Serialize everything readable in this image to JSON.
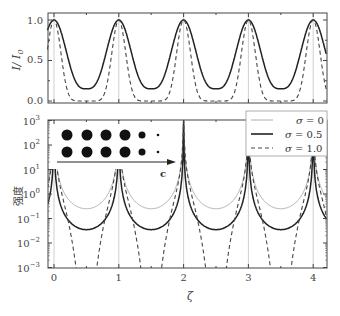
{
  "chart_data": [
    {
      "type": "line",
      "panel": "top",
      "ylabel": "I / I0",
      "ylabel_display": "I/ I₀",
      "xlim": [
        -0.1,
        4.2
      ],
      "ylim": [
        0.0,
        1.1
      ],
      "yticks": [
        0.0,
        0.5,
        1.0
      ],
      "ytick_labels": [
        "0.0",
        "0.5",
        "1.0"
      ],
      "xticks": [
        0,
        1,
        2,
        3,
        4
      ],
      "vertical_gridlines_at": [
        0,
        1,
        2,
        3,
        4
      ],
      "series": [
        {
          "name": "σ = 0.5",
          "style": "solid",
          "color": "#222222",
          "period": 1,
          "max": 1.0,
          "min": 0.15
        },
        {
          "name": "σ = 1.0",
          "style": "dashed",
          "color": "#444444",
          "period": 1,
          "max": 1.0,
          "min": 0.0
        }
      ]
    },
    {
      "type": "line",
      "panel": "bottom",
      "yscale": "log",
      "xlabel": "ζ",
      "ylabel": "强度",
      "xlim": [
        -0.1,
        4.2
      ],
      "ylim": [
        0.001,
        1000
      ],
      "yticks": [
        0.001,
        0.01,
        0.1,
        1,
        10,
        100,
        1000
      ],
      "ytick_labels": [
        "10⁻³",
        "10⁻²",
        "10⁻¹",
        "10⁰",
        "10¹",
        "10²",
        "10³"
      ],
      "xticks": [
        0,
        1,
        2,
        3,
        4
      ],
      "xtick_labels": [
        "0",
        "1",
        "2",
        "3",
        "4"
      ],
      "vertical_gridlines_at": [
        0,
        1,
        2,
        3,
        4
      ],
      "legend": {
        "position": "upper right",
        "entries": [
          "σ = 0",
          "σ = 0.5",
          "σ = 1.0"
        ]
      },
      "series": [
        {
          "name": "σ = 0",
          "style": "thin solid",
          "color": "#999999",
          "period": 1,
          "peak": 1000,
          "min": 0.25
        },
        {
          "name": "σ = 0.5",
          "style": "solid",
          "color": "#222222",
          "period": 1,
          "peak": 1000,
          "min": 0.035
        },
        {
          "name": "σ = 1.0",
          "style": "dashed",
          "color": "#444444",
          "period": 1,
          "peak": 1000,
          "min": 0.0005
        }
      ],
      "inset": {
        "description": "two rows of black dots with decreasing size, arrow pointing right labeled c",
        "rows": 2,
        "dot_radii": [
          5.5,
          5.5,
          5.5,
          5.5,
          3.5,
          1.3
        ],
        "arrow_label": "c"
      }
    }
  ],
  "labels": {
    "top_ylabel_I": "I/ I",
    "top_ylabel_sub": "0",
    "bottom_ylabel": "强度",
    "xlabel": "ζ",
    "inset_arrow": "c",
    "legend": [
      {
        "prefix": "σ",
        "rest": " = 0"
      },
      {
        "prefix": "σ",
        "rest": " = 0.5"
      },
      {
        "prefix": "σ",
        "rest": " = 1.0"
      }
    ],
    "top_yticks": [
      "1.0",
      "0.5",
      "0.0"
    ],
    "bottom_ytick_base": "10",
    "bottom_ytick_exps": [
      "3",
      "2",
      "1",
      "0",
      "−1",
      "−2",
      "−3"
    ],
    "xticks": [
      "0",
      "1",
      "2",
      "3",
      "4"
    ]
  }
}
